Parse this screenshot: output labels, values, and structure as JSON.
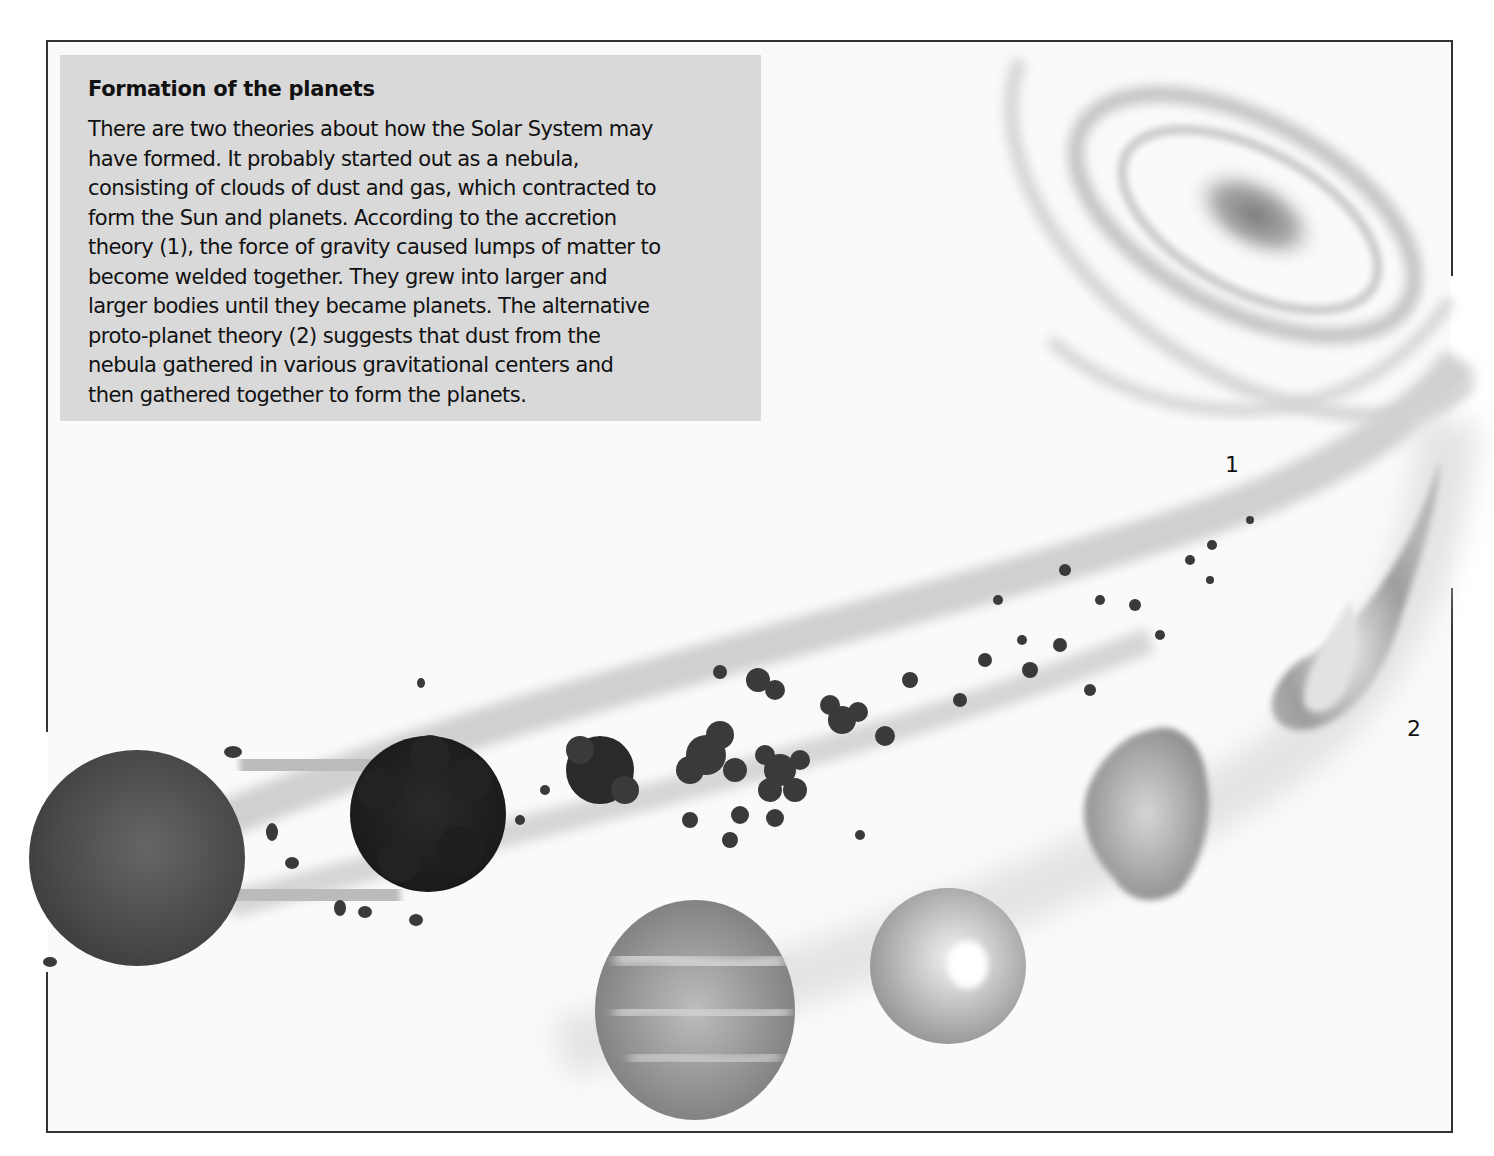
{
  "figure": {
    "title": "Formation of the planets",
    "body": "There are two theories about how the Solar System may\nhave formed. It probably started out as a nebula,\nconsisting of clouds of dust and gas, which contracted to\nform the Sun and planets. According to the accretion\ntheory (1), the force of gravity caused lumps of matter to\nbecome welded together. They grew into larger and\nlarger bodies until they became planets. The alternative\nproto-planet theory (2) suggests that dust from the\nnebula gathered in various gravitational centers and\nthen gathered together to form the planets.",
    "labels": {
      "accretion": "1",
      "proto_planet": "2"
    },
    "colors": {
      "textbox_bg": "#d9d9d9",
      "frame": "#333333",
      "planet_dark": "#3a3a3a",
      "planet_mid": "#555555",
      "gas_light": "#9a9a9a"
    },
    "elements": [
      "spiral-nebula",
      "accretion-stream",
      "proto-planet-stream",
      "finished-planet-left",
      "accreting-lump-large",
      "accreting-clusters",
      "gas-teardrop",
      "gas-cloud-blob",
      "proto-planet-sphere",
      "banded-gas-giant"
    ]
  }
}
